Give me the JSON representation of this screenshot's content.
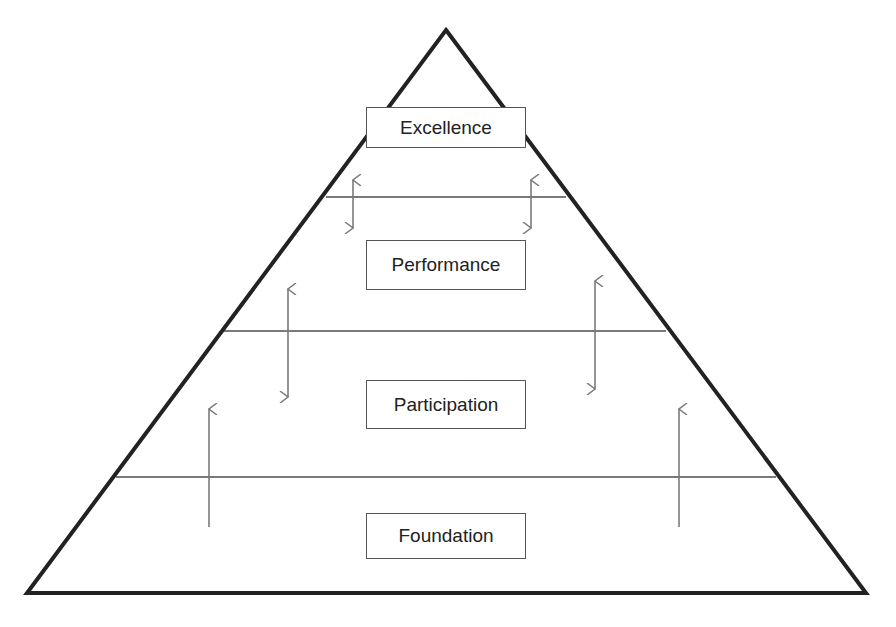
{
  "diagram": {
    "type": "pyramid",
    "tiers": [
      {
        "label": "Excellence"
      },
      {
        "label": "Performance"
      },
      {
        "label": "Participation"
      },
      {
        "label": "Foundation"
      }
    ],
    "colors": {
      "outline": "#222222",
      "divider": "#7a7a7a",
      "arrow": "#7a7a7a"
    }
  }
}
